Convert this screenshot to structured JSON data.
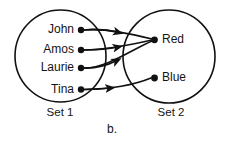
{
  "figure": {
    "caption": "b.",
    "sets": [
      {
        "id": "set1",
        "label": "Set 1"
      },
      {
        "id": "set2",
        "label": "Set 2"
      }
    ],
    "left_items": [
      {
        "label": "John"
      },
      {
        "label": "Amos"
      },
      {
        "label": "Laurie"
      },
      {
        "label": "Tina"
      }
    ],
    "right_items": [
      {
        "label": "Red"
      },
      {
        "label": "Blue"
      }
    ],
    "mappings": [
      {
        "from": "John",
        "to": "Red"
      },
      {
        "from": "Amos",
        "to": "Red"
      },
      {
        "from": "Laurie",
        "to": "Red"
      },
      {
        "from": "Tina",
        "to": "Blue"
      }
    ],
    "colors": {
      "ink": "#111111",
      "background": "#ffffff"
    }
  }
}
